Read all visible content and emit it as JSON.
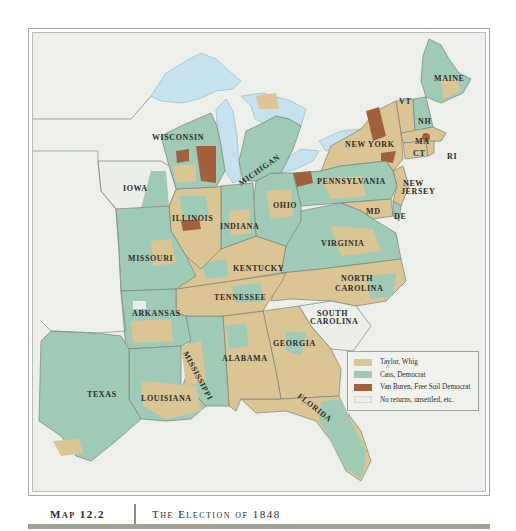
{
  "map": {
    "title": "The Election of 1848",
    "map_number": "Map 12.2",
    "colors": {
      "whig": "#dcc595",
      "democrat": "#9fcab6",
      "free_soil": "#a2603d",
      "no_returns": "#eceee9",
      "water": "#c5e2ee",
      "land_outside": "#eceee9",
      "border": "#7a8076"
    },
    "legend": {
      "items": [
        {
          "label": "Taylor, Whig",
          "color": "#dcc595"
        },
        {
          "label": "Cass, Democrat",
          "color": "#9fcab6"
        },
        {
          "label": "Van Buren, Free Soil Democrat",
          "color": "#a2603d"
        },
        {
          "label": "No returns, unsettled, etc.",
          "color": "#eceee9"
        }
      ]
    },
    "state_labels": {
      "maine": "MAINE",
      "vt": "VT",
      "nh": "NH",
      "ma": "MA",
      "ct": "CT",
      "ri": "RI",
      "new_york": "NEW YORK",
      "new_jersey_1": "NEW",
      "new_jersey_2": "JERSEY",
      "pennsylvania": "PENNSYLVANIA",
      "md": "MD",
      "de": "DE",
      "wisconsin": "WISCONSIN",
      "michigan": "MICHIGAN",
      "iowa": "IOWA",
      "illinois": "ILLINOIS",
      "indiana": "INDIANA",
      "ohio": "OHIO",
      "virginia": "VIRGINIA",
      "missouri": "MISSOURI",
      "kentucky": "KENTUCKY",
      "north_carolina_1": "NORTH",
      "north_carolina_2": "CAROLINA",
      "tennessee": "TENNESSEE",
      "arkansas": "ARKANSAS",
      "south_carolina_1": "SOUTH",
      "south_carolina_2": "CAROLINA",
      "mississippi": "MISSISSIPPI",
      "alabama": "ALABAMA",
      "georgia": "GEORGIA",
      "texas": "TEXAS",
      "louisiana": "LOUISIANA",
      "florida": "FLORIDA"
    }
  }
}
